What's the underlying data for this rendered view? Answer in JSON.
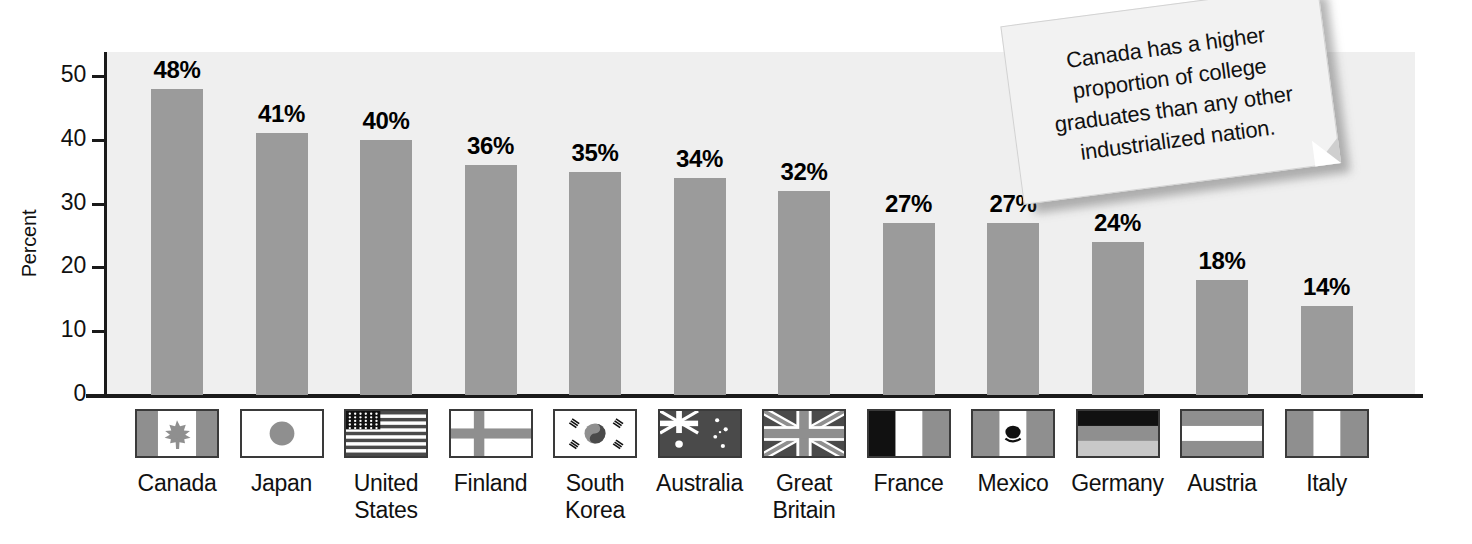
{
  "chart_data": {
    "type": "bar",
    "title": "",
    "xlabel": "",
    "ylabel": "Percent",
    "ylim": [
      0,
      50
    ],
    "yticks": [
      0,
      10,
      20,
      30,
      40,
      50
    ],
    "ytick_labels": [
      "0",
      "10",
      "20",
      "30",
      "40",
      "50"
    ],
    "grid": false,
    "legend": "none",
    "value_label_suffix": "%",
    "categories": [
      "Canada",
      "Japan",
      "United States",
      "Finland",
      "South Korea",
      "Australia",
      "Great Britain",
      "France",
      "Mexico",
      "Germany",
      "Austria",
      "Italy"
    ],
    "category_lines": [
      [
        "Canada"
      ],
      [
        "Japan"
      ],
      [
        "United",
        "States"
      ],
      [
        "Finland"
      ],
      [
        "South",
        "Korea"
      ],
      [
        "Australia"
      ],
      [
        "Great",
        "Britain"
      ],
      [
        "France"
      ],
      [
        "Mexico"
      ],
      [
        "Germany"
      ],
      [
        "Austria"
      ],
      [
        "Italy"
      ]
    ],
    "values": [
      48,
      41,
      40,
      36,
      35,
      34,
      32,
      27,
      27,
      24,
      18,
      14
    ],
    "value_labels": [
      "48%",
      "41%",
      "40%",
      "36%",
      "35%",
      "34%",
      "32%",
      "27%",
      "27%",
      "24%",
      "18%",
      "14%"
    ],
    "bar_color": "#9b9b9b",
    "plot_background": "#efefef",
    "axis_color": "#1a1a1a",
    "flags": [
      "flag-canada-icon",
      "flag-japan-icon",
      "flag-united-states-icon",
      "flag-finland-icon",
      "flag-south-korea-icon",
      "flag-australia-icon",
      "flag-great-britain-icon",
      "flag-france-icon",
      "flag-mexico-icon",
      "flag-germany-icon",
      "flag-austria-icon",
      "flag-italy-icon"
    ]
  },
  "callout": {
    "text": "Canada has a higher proportion of college graduates than any other industrialized nation."
  }
}
